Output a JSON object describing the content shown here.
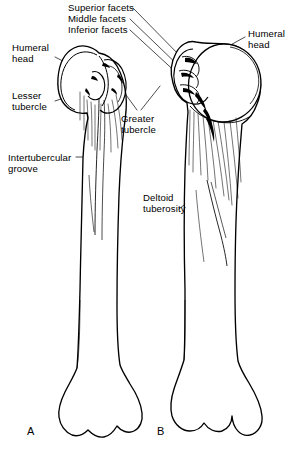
{
  "figure": {
    "width": 302,
    "height": 452,
    "background": "#ffffff",
    "ink_color": "#000000"
  },
  "annotations": {
    "superior_facets": "Superior facets",
    "middle_facets": "Middle facets",
    "inferior_facets": "Inferior facets",
    "humeral_head_left": "Humeral\nhead",
    "lesser_tubercle": "Lesser\ntubercle",
    "intertubercular_groove": "Intertubercular\ngroove",
    "greater_tubercle": "Greater\ntubercle",
    "deltoid_tuberosity": "Deltoid\ntuberosity",
    "humeral_head_right": "Humeral\nhead"
  },
  "panels": [
    {
      "letter": "A",
      "view": "anterior"
    },
    {
      "letter": "B",
      "view": "posterior"
    }
  ],
  "panel_labels": {
    "a": "A",
    "b": "B"
  }
}
